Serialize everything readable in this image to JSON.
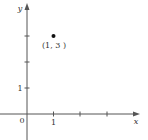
{
  "diagram": {
    "type": "coordinate-plane",
    "axes": {
      "x_label": "x",
      "y_label": "y",
      "origin_label": "0",
      "x_tick_labels": [
        "1"
      ],
      "y_tick_labels": [
        "1"
      ]
    },
    "point": {
      "x": 1,
      "y": 3,
      "label": "(1, 3 )"
    },
    "colors": {
      "axis": "#555555",
      "point": "#111111",
      "text": "#333333"
    }
  }
}
